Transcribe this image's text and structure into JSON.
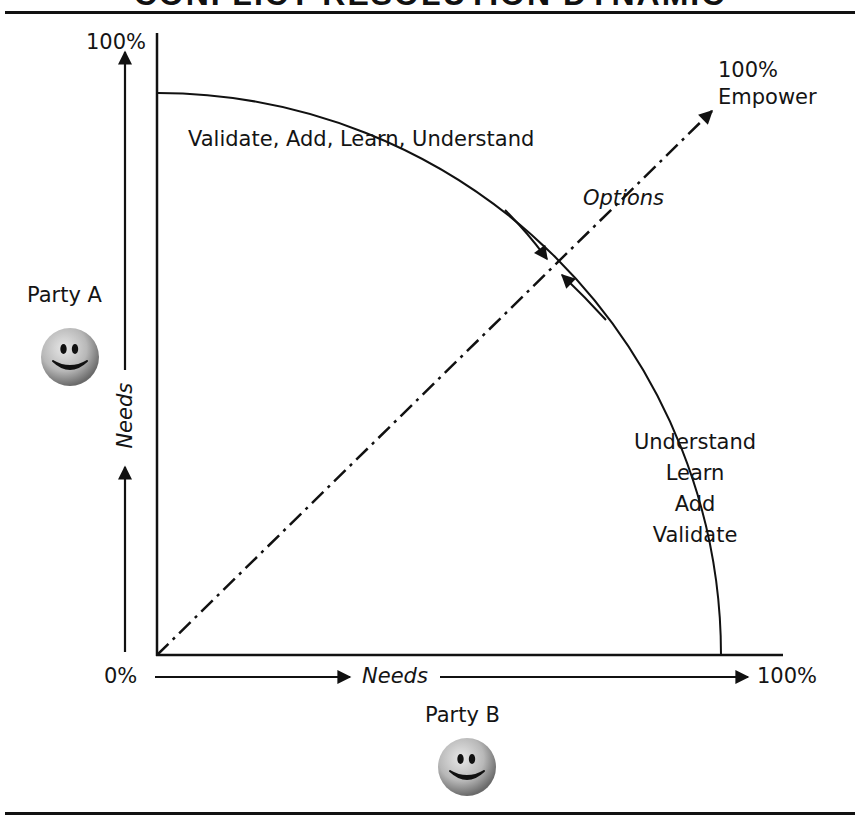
{
  "title": "CONFLICT RESOLUTION DYNAMIC",
  "axes": {
    "y_top_label": "100%",
    "origin_label": "0%",
    "x_right_label": "100%",
    "y_axis_label": "Needs",
    "x_axis_label": "Needs"
  },
  "parties": {
    "a": {
      "label": "Party A",
      "icon": "smiley-face-icon"
    },
    "b": {
      "label": "Party B",
      "icon": "smiley-face-icon"
    }
  },
  "diagonal": {
    "end_label_line1": "100%",
    "end_label_line2": "Empower",
    "mid_label": "Options"
  },
  "arc": {
    "top_label": "Validate, Add, Learn, Understand",
    "right_labels": [
      "Understand",
      "Learn",
      "Add",
      "Validate"
    ]
  },
  "colors": {
    "line": "#111111",
    "background": "#ffffff",
    "smiley_face": "#b9b9b9",
    "smiley_features": "#111111"
  }
}
